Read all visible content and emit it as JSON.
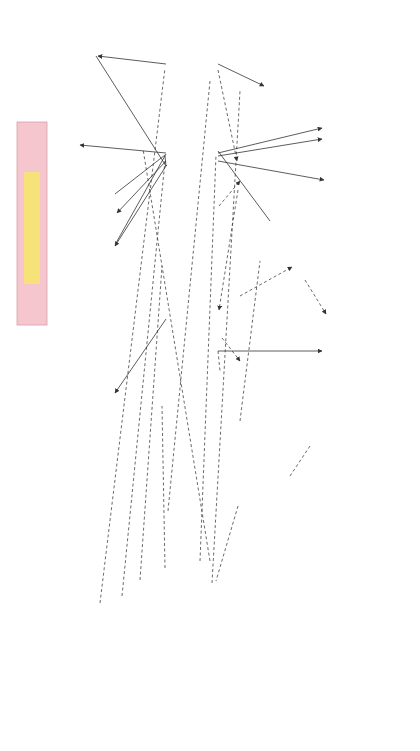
{
  "colors": {
    "accent_pink": "#c8485a",
    "title_band": "#f6c6cf",
    "title_highlight": "#f7e27a",
    "shadow_pink": "#f2b8c2",
    "line": "#333333"
  },
  "operational_steps": [
    {
      "id": "formulating",
      "lines": [
        "Formulating",
        "a research",
        "problem"
      ]
    },
    {
      "id": "conceptualising",
      "lines": [
        "Conceptualising",
        "a research",
        "design"
      ]
    },
    {
      "id": "constructing",
      "lines": [
        "Constructing",
        "an instrument",
        "for data",
        "collection"
      ]
    },
    {
      "id": "selecting",
      "lines": [
        "Selecting",
        "a sample"
      ]
    },
    {
      "id": "writing-proposal",
      "lines": [
        "Writing a",
        "research",
        "proposal"
      ]
    },
    {
      "id": "collecting",
      "lines": [
        "Collecting",
        "data"
      ]
    },
    {
      "id": "processing",
      "lines": [
        "Processing",
        "data"
      ]
    },
    {
      "id": "writing-report",
      "lines": [
        "Writing",
        "a research",
        "report"
      ]
    }
  ],
  "theoretical_knowledge_top": [
    {
      "id": "considerations",
      "lines": [
        "Considerations",
        "and steps in",
        "formulating a",
        "research problem"
      ]
    },
    {
      "id": "research-design",
      "lines": [
        "Research design:",
        "functions"
      ]
    },
    {
      "id": "methods-collection",
      "lines": [
        "Methods and",
        "tools of data",
        "collection"
      ]
    },
    {
      "id": "sampling",
      "lines": [
        "Sampling theory",
        "and designs"
      ]
    },
    {
      "id": "methods-processing",
      "lines": [
        "Methods of data",
        "processing",
        "Use of computers",
        "and statistics"
      ]
    },
    {
      "id": "scientific-writing",
      "lines": [
        "Principles of",
        "scientific writing"
      ]
    }
  ],
  "theoretical_knowledge_bottom": [
    {
      "id": "variables",
      "lines": [
        "Variables and",
        "hypotheses:",
        "definition and typology"
      ]
    },
    {
      "id": "study-designs",
      "lines": [
        "Study designs"
      ]
    },
    {
      "id": "validity",
      "lines": [
        "Validity and",
        "reliability of the",
        "research tool"
      ]
    },
    {
      "id": "contents-proposal",
      "lines": [
        "Contents of the",
        "research proposal"
      ]
    }
  ],
  "intermediary_knowledge": [
    {
      "id": "literature-review",
      "lines": [
        "Literature",
        "review"
      ]
    },
    {
      "id": "field-test",
      "lines": [
        "Field",
        "test of the",
        "research",
        "tool"
      ]
    },
    {
      "id": "editing",
      "lines": [
        "Editing",
        "of the",
        "data"
      ]
    },
    {
      "id": "code-book",
      "lines": [
        "Developing",
        "a code",
        "book"
      ]
    },
    {
      "id": "coding",
      "lines": [
        "Coding"
      ]
    }
  ],
  "legend": {
    "operational": [
      "Operational",
      "steps"
    ],
    "theoretical": [
      "Required",
      "theoretical",
      "knowledge"
    ],
    "intermediary": [
      "Required",
      "intermediary",
      "knowledge"
    ]
  },
  "sections": {
    "deciding": "Deciding what",
    "planning": "Planning how",
    "conducting": "Conducting the study"
  }
}
